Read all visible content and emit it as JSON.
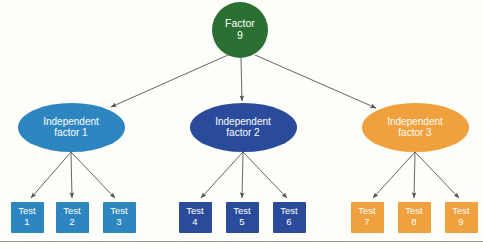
{
  "diagram": {
    "type": "hierarchical-tree",
    "background_color": "#fdfdfa",
    "edge_color": "#555555",
    "baseline_rule_color": "#9a9a93",
    "levels": 3,
    "root": {
      "name": "root-factor-node",
      "label": "Factor\n9",
      "title": "Factor",
      "value": "9",
      "shape": "circle",
      "color": "#2b7032",
      "text_color": "#ffffff",
      "x": 240,
      "y": 30,
      "width": 56,
      "height": 56
    },
    "factors": [
      {
        "name": "independent-factor-1-node",
        "label": "Independent\nfactor 1",
        "line1": "Independent",
        "line2": "factor 1",
        "shape": "ellipse",
        "color": "#2e86c1",
        "text_color": "#ffffff",
        "x": 71,
        "y": 127,
        "width": 107,
        "height": 49
      },
      {
        "name": "independent-factor-2-node",
        "label": "Independent\nfactor 2",
        "line1": "Independent",
        "line2": "factor 2",
        "shape": "ellipse",
        "color": "#2a4b9b",
        "text_color": "#ffffff",
        "x": 243,
        "y": 127,
        "width": 107,
        "height": 49
      },
      {
        "name": "independent-factor-3-node",
        "label": "Independent\nfactor 3",
        "line1": "Independent",
        "line2": "factor 3",
        "shape": "ellipse",
        "color": "#f0a03c",
        "text_color": "#ffffff",
        "x": 415,
        "y": 127,
        "width": 107,
        "height": 49
      }
    ],
    "tests": [
      {
        "name": "test-1-node",
        "label": "Test\n1",
        "title": "Test",
        "value": "1",
        "shape": "square",
        "color": "#2e86c1",
        "parent": "independent-factor-1-node",
        "x": 27,
        "y": 217,
        "width": 33,
        "height": 31
      },
      {
        "name": "test-2-node",
        "label": "Test\n2",
        "title": "Test",
        "value": "2",
        "shape": "square",
        "color": "#2e86c1",
        "parent": "independent-factor-1-node",
        "x": 72,
        "y": 217,
        "width": 33,
        "height": 31
      },
      {
        "name": "test-3-node",
        "label": "Test\n3",
        "title": "Test",
        "value": "3",
        "shape": "square",
        "color": "#2e86c1",
        "parent": "independent-factor-1-node",
        "x": 119,
        "y": 217,
        "width": 33,
        "height": 31
      },
      {
        "name": "test-4-node",
        "label": "Test\n4",
        "title": "Test",
        "value": "4",
        "shape": "square",
        "color": "#2a4b9b",
        "parent": "independent-factor-2-node",
        "x": 195,
        "y": 217,
        "width": 33,
        "height": 31
      },
      {
        "name": "test-5-node",
        "label": "Test\n5",
        "title": "Test",
        "value": "5",
        "shape": "square",
        "color": "#2a4b9b",
        "parent": "independent-factor-2-node",
        "x": 242,
        "y": 217,
        "width": 33,
        "height": 31
      },
      {
        "name": "test-6-node",
        "label": "Test\n6",
        "title": "Test",
        "value": "6",
        "shape": "square",
        "color": "#2a4b9b",
        "parent": "independent-factor-2-node",
        "x": 289,
        "y": 217,
        "width": 33,
        "height": 31
      },
      {
        "name": "test-7-node",
        "label": "Test\n7",
        "title": "Test",
        "value": "7",
        "shape": "square",
        "color": "#f0a03c",
        "parent": "independent-factor-3-node",
        "x": 367,
        "y": 217,
        "width": 33,
        "height": 31
      },
      {
        "name": "test-8-node",
        "label": "Test\n8",
        "title": "Test",
        "value": "8",
        "shape": "square",
        "color": "#f0a03c",
        "parent": "independent-factor-3-node",
        "x": 414,
        "y": 217,
        "width": 33,
        "height": 31
      },
      {
        "name": "test-9-node",
        "label": "Test\n9",
        "title": "Test",
        "value": "9",
        "shape": "square",
        "color": "#f0a03c",
        "parent": "independent-factor-3-node",
        "x": 461,
        "y": 217,
        "width": 33,
        "height": 31
      }
    ],
    "edges": [
      {
        "name": "edge-root-to-factor-1",
        "from": "root-factor-node",
        "to": "independent-factor-1-node",
        "x1": 228,
        "y1": 55,
        "x2": 111,
        "y2": 107
      },
      {
        "name": "edge-root-to-factor-2",
        "from": "root-factor-node",
        "to": "independent-factor-2-node",
        "x1": 241,
        "y1": 58,
        "x2": 242,
        "y2": 101
      },
      {
        "name": "edge-root-to-factor-3",
        "from": "root-factor-node",
        "to": "independent-factor-3-node",
        "x1": 255,
        "y1": 55,
        "x2": 376,
        "y2": 108
      },
      {
        "name": "edge-factor-1-to-test-1",
        "from": "independent-factor-1-node",
        "to": "test-1-node",
        "x1": 71,
        "y1": 152,
        "x2": 31,
        "y2": 198
      },
      {
        "name": "edge-factor-1-to-test-2",
        "from": "independent-factor-1-node",
        "to": "test-2-node",
        "x1": 71,
        "y1": 152,
        "x2": 72,
        "y2": 198
      },
      {
        "name": "edge-factor-1-to-test-3",
        "from": "independent-factor-1-node",
        "to": "test-3-node",
        "x1": 71,
        "y1": 152,
        "x2": 115,
        "y2": 198
      },
      {
        "name": "edge-factor-2-to-test-4",
        "from": "independent-factor-2-node",
        "to": "test-4-node",
        "x1": 243,
        "y1": 152,
        "x2": 201,
        "y2": 198
      },
      {
        "name": "edge-factor-2-to-test-5",
        "from": "independent-factor-2-node",
        "to": "test-5-node",
        "x1": 243,
        "y1": 152,
        "x2": 242,
        "y2": 198
      },
      {
        "name": "edge-factor-2-to-test-6",
        "from": "independent-factor-2-node",
        "to": "test-6-node",
        "x1": 243,
        "y1": 152,
        "x2": 287,
        "y2": 198
      },
      {
        "name": "edge-factor-3-to-test-7",
        "from": "independent-factor-3-node",
        "to": "test-7-node",
        "x1": 415,
        "y1": 152,
        "x2": 373,
        "y2": 198
      },
      {
        "name": "edge-factor-3-to-test-8",
        "from": "independent-factor-3-node",
        "to": "test-8-node",
        "x1": 415,
        "y1": 152,
        "x2": 414,
        "y2": 198
      },
      {
        "name": "edge-factor-3-to-test-9",
        "from": "independent-factor-3-node",
        "to": "test-9-node",
        "x1": 415,
        "y1": 152,
        "x2": 459,
        "y2": 198
      }
    ],
    "baseline_rule": {
      "name": "baseline-rule",
      "y": 241
    }
  }
}
